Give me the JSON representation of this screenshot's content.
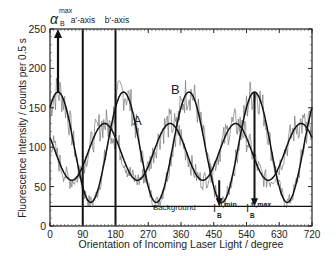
{
  "chart_data": {
    "type": "line",
    "title": "",
    "xlabel": "Orientation of Incoming Laser Light / degree",
    "ylabel": "Fluorescence Intensity / counts per 0.5 s",
    "xlim": [
      0,
      720
    ],
    "ylim": [
      0,
      250
    ],
    "xticks": [
      0,
      90,
      180,
      270,
      360,
      450,
      540,
      630,
      720
    ],
    "yticks": [
      0,
      50,
      100,
      150,
      200,
      250
    ],
    "grid": false,
    "legend": "inline labels",
    "series": [
      {
        "name": "B",
        "model": "sin^2 fit",
        "period_deg": 180,
        "max": 170,
        "min": 30,
        "max_at_deg": [
          22,
          202,
          382,
          562
        ]
      },
      {
        "name": "A",
        "model": "sin^2 fit",
        "period_deg": 180,
        "max": 130,
        "min": 58,
        "max_at_deg": [
          150,
          330,
          510,
          690
        ]
      }
    ],
    "background_level": 25,
    "annotations": [
      {
        "text": "a'-axis",
        "x": 90,
        "type": "vertical-line"
      },
      {
        "text": "b'-axis",
        "x": 180,
        "type": "vertical-line"
      },
      {
        "text": "α_B^max",
        "x": 22,
        "type": "arrow-up"
      },
      {
        "text": "Background",
        "y": 25,
        "type": "horizontal-line"
      },
      {
        "text": "I_B^fl,min",
        "x": 465,
        "from": 58,
        "to": 25,
        "type": "arrow-down"
      },
      {
        "text": "I_B^fl,max",
        "x": 562,
        "from": 170,
        "to": 25,
        "type": "arrow-down"
      },
      {
        "text": "A",
        "x": 320,
        "y": 137
      },
      {
        "text": "B",
        "x": 345,
        "y": 175
      }
    ]
  },
  "labels": {
    "alpha_main": "α",
    "alpha_sub": "B",
    "alpha_sup": "max",
    "a_axis": "a'-axis",
    "b_axis": "b'-axis",
    "background": "Background",
    "imin_main": "I",
    "imin_sup": "fl,min",
    "imin_sub": "B",
    "imax_main": "I",
    "imax_sup": "fl,max",
    "imax_sub": "B",
    "curve_a": "A",
    "curve_b": "B"
  }
}
